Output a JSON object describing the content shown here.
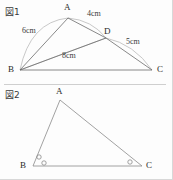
{
  "page": {
    "background": "#fdfdfd",
    "ink": "#555555",
    "arc_color": "#b9b9b9"
  },
  "figures": [
    {
      "id": "figure-1",
      "caption": "図1",
      "type": "triangle-with-cevian",
      "vertices": [
        {
          "name": "A",
          "label": "A",
          "x": 68,
          "y": 18
        },
        {
          "name": "B",
          "label": "B",
          "x": 20,
          "y": 70
        },
        {
          "name": "C",
          "label": "C",
          "x": 152,
          "y": 70
        },
        {
          "name": "D",
          "label": "D",
          "x": 106,
          "y": 38
        }
      ],
      "segments": [
        {
          "from": "B",
          "to": "A"
        },
        {
          "from": "A",
          "to": "D"
        },
        {
          "from": "D",
          "to": "C"
        },
        {
          "from": "B",
          "to": "C"
        },
        {
          "from": "B",
          "to": "D"
        }
      ],
      "measurements": [
        {
          "label": "6cm",
          "segment": "B-A",
          "value": 6,
          "unit": "cm"
        },
        {
          "label": "4cm",
          "segment": "A-D",
          "value": 4,
          "unit": "cm"
        },
        {
          "label": "5cm",
          "segment": "D-C",
          "value": 5,
          "unit": "cm"
        },
        {
          "label": "8cm",
          "segment": "B-D",
          "value": 8,
          "unit": "cm"
        }
      ]
    },
    {
      "id": "figure-2",
      "caption": "図2",
      "type": "triangle-with-angle-marks",
      "vertices": [
        {
          "name": "A",
          "label": "A",
          "x": 60,
          "y": 96
        },
        {
          "name": "B",
          "label": "B",
          "x": 33,
          "y": 166
        },
        {
          "name": "C",
          "label": "C",
          "x": 142,
          "y": 166
        }
      ],
      "segments": [
        {
          "from": "A",
          "to": "B"
        },
        {
          "from": "A",
          "to": "C"
        },
        {
          "from": "B",
          "to": "C"
        }
      ],
      "angle_marks": [
        {
          "vertex": "B",
          "count": 2,
          "style": "small-circle"
        },
        {
          "vertex": "C",
          "count": 1,
          "style": "small-circle"
        }
      ]
    }
  ],
  "labels": {
    "fig1_caption": "図1",
    "fig2_caption": "図2",
    "fig1_A": "A",
    "fig1_B": "B",
    "fig1_C": "C",
    "fig1_D": "D",
    "fig1_m_6cm": "6cm",
    "fig1_m_4cm": "4cm",
    "fig1_m_5cm": "5cm",
    "fig1_m_8cm": "8cm",
    "fig2_A": "A",
    "fig2_B": "B",
    "fig2_C": "C"
  }
}
